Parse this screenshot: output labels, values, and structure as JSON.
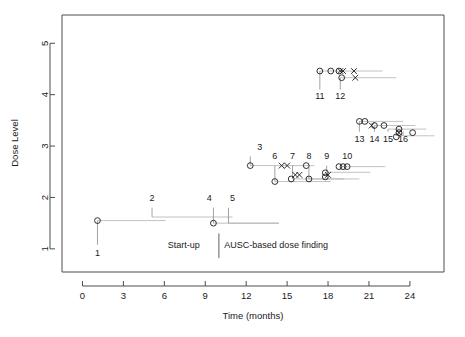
{
  "chart_data": {
    "type": "scatter",
    "title": "",
    "xlabel": "Time (months)",
    "ylabel": "Dose Level",
    "xlim": [
      -1.5,
      26.5
    ],
    "ylim": [
      0.55,
      5.55
    ],
    "xticks": [
      0,
      3,
      6,
      9,
      12,
      15,
      18,
      21,
      24
    ],
    "xtick_labels": [
      "0",
      "3",
      "6",
      "9",
      "12",
      "15",
      "18",
      "21",
      "24"
    ],
    "yticks": [
      1,
      2,
      3,
      4,
      5
    ],
    "ytick_labels": [
      "1",
      "2",
      "3",
      "4",
      "5"
    ],
    "grid": false,
    "legend": null,
    "annotations": [
      {
        "name": "phase-startup",
        "text": "Start-up",
        "x": 8.6,
        "y": 1.08
      },
      {
        "name": "phase-ausc",
        "text": "AUSC-based dose finding",
        "x": 10.4,
        "y": 1.08
      }
    ],
    "phase_divider_x": 10.0,
    "cohorts": [
      {
        "id": "1",
        "label_x": 1.1,
        "label_y": 0.86,
        "line_x0": 1.1,
        "line_x1": 6.1,
        "line_y": 1.55,
        "leader_from_y": 1.08,
        "points": [
          {
            "x": 1.1,
            "y": 1.55,
            "marker": "circle"
          }
        ]
      },
      {
        "id": "2",
        "label_x": 5.1,
        "label_y": 1.93,
        "line_x0": 5.1,
        "line_x1": 11.0,
        "line_y": 1.62,
        "leader_from_y": 1.8,
        "points": []
      },
      {
        "id": "3",
        "label_x": 13.0,
        "label_y": 2.93,
        "line_x0": 12.3,
        "line_x1": 17.0,
        "line_y": 2.62,
        "leader_from_y": 2.8,
        "points": [
          {
            "x": 12.3,
            "y": 2.62,
            "marker": "circle"
          },
          {
            "x": 14.6,
            "y": 2.62,
            "marker": "cross"
          },
          {
            "x": 15.0,
            "y": 2.62,
            "marker": "cross"
          },
          {
            "x": 16.4,
            "y": 2.62,
            "marker": "circle"
          }
        ]
      },
      {
        "id": "4",
        "label_x": 9.3,
        "label_y": 1.93,
        "line_x0": 9.6,
        "line_x1": 14.4,
        "line_y": 1.5,
        "leader_from_y": 1.8,
        "points": [
          {
            "x": 9.6,
            "y": 1.5,
            "marker": "circle"
          }
        ]
      },
      {
        "id": "5",
        "label_x": 11.0,
        "label_y": 1.93,
        "line_x0": 10.7,
        "line_x1": 14.4,
        "line_y": 1.5,
        "leader_from_y": 1.8,
        "points": []
      },
      {
        "id": "6",
        "label_x": 14.1,
        "label_y": 2.74,
        "line_x0": 14.1,
        "line_x1": 18.2,
        "line_y": 2.31,
        "leader_from_y": 2.62,
        "points": [
          {
            "x": 14.1,
            "y": 2.31,
            "marker": "circle"
          }
        ]
      },
      {
        "id": "7",
        "label_x": 15.4,
        "label_y": 2.74,
        "line_x0": 15.4,
        "line_x1": 19.2,
        "line_y": 2.36,
        "leader_from_y": 2.62,
        "points": [
          {
            "x": 15.3,
            "y": 2.36,
            "marker": "circle"
          },
          {
            "x": 15.6,
            "y": 2.44,
            "marker": "cross"
          },
          {
            "x": 15.9,
            "y": 2.44,
            "marker": "cross"
          }
        ]
      },
      {
        "id": "8",
        "label_x": 16.6,
        "label_y": 2.74,
        "line_x0": 16.6,
        "line_x1": 20.3,
        "line_y": 2.36,
        "leader_from_y": 2.62,
        "points": [
          {
            "x": 16.6,
            "y": 2.36,
            "marker": "circle"
          }
        ]
      },
      {
        "id": "9",
        "label_x": 17.9,
        "label_y": 2.74,
        "line_x0": 17.9,
        "line_x1": 21.1,
        "line_y": 2.49,
        "leader_from_y": 2.62,
        "points": [
          {
            "x": 17.8,
            "y": 2.48,
            "marker": "circle"
          },
          {
            "x": 17.8,
            "y": 2.4,
            "marker": "circle"
          },
          {
            "x": 18.0,
            "y": 2.44,
            "marker": "cross"
          }
        ]
      },
      {
        "id": "10",
        "label_x": 19.4,
        "label_y": 2.74,
        "line_x0": 19.0,
        "line_x1": 22.2,
        "line_y": 2.6,
        "leader_from_y": 2.62,
        "points": [
          {
            "x": 18.8,
            "y": 2.6,
            "marker": "circle"
          },
          {
            "x": 19.1,
            "y": 2.6,
            "marker": "circle"
          },
          {
            "x": 19.4,
            "y": 2.6,
            "marker": "circle"
          }
        ]
      },
      {
        "id": "11",
        "label_x": 17.4,
        "label_y": 3.92,
        "line_x0": 17.4,
        "line_x1": 22.0,
        "line_y": 4.46,
        "leader_from_y": 4.1,
        "points": [
          {
            "x": 17.4,
            "y": 4.46,
            "marker": "circle"
          },
          {
            "x": 18.2,
            "y": 4.46,
            "marker": "circle"
          }
        ]
      },
      {
        "id": "12",
        "label_x": 18.9,
        "label_y": 3.92,
        "line_x0": 18.9,
        "line_x1": 23.0,
        "line_y": 4.33,
        "leader_from_y": 4.1,
        "points": [
          {
            "x": 18.8,
            "y": 4.46,
            "marker": "circle"
          },
          {
            "x": 18.9,
            "y": 4.46,
            "marker": "cross"
          },
          {
            "x": 19.1,
            "y": 4.46,
            "marker": "cross"
          },
          {
            "x": 19.0,
            "y": 4.33,
            "marker": "circle"
          },
          {
            "x": 19.9,
            "y": 4.46,
            "marker": "cross"
          },
          {
            "x": 20.0,
            "y": 4.33,
            "marker": "cross"
          }
        ]
      },
      {
        "id": "13",
        "label_x": 20.3,
        "label_y": 3.08,
        "line_x0": 20.3,
        "line_x1": 23.5,
        "line_y": 3.48,
        "leader_from_y": 3.28,
        "points": [
          {
            "x": 20.3,
            "y": 3.48,
            "marker": "circle"
          },
          {
            "x": 20.7,
            "y": 3.48,
            "marker": "circle"
          }
        ]
      },
      {
        "id": "14",
        "label_x": 21.4,
        "label_y": 3.08,
        "line_x0": 21.4,
        "line_x1": 24.4,
        "line_y": 3.4,
        "leader_from_y": 3.28,
        "points": [
          {
            "x": 21.2,
            "y": 3.4,
            "marker": "cross"
          },
          {
            "x": 21.4,
            "y": 3.4,
            "marker": "circle"
          },
          {
            "x": 22.1,
            "y": 3.4,
            "marker": "circle"
          }
        ]
      },
      {
        "id": "15",
        "label_x": 22.4,
        "label_y": 3.08,
        "line_x0": 22.4,
        "line_x1": 25.2,
        "line_y": 3.33,
        "leader_from_y": 3.28,
        "points": [
          {
            "x": 23.2,
            "y": 3.33,
            "marker": "circle"
          }
        ]
      },
      {
        "id": "16",
        "label_x": 23.5,
        "label_y": 3.08,
        "line_x0": 23.5,
        "line_x1": 25.8,
        "line_y": 3.2,
        "leader_from_y": 3.28,
        "points": [
          {
            "x": 23.2,
            "y": 3.26,
            "marker": "cross"
          },
          {
            "x": 23.2,
            "y": 3.26,
            "marker": "circle"
          },
          {
            "x": 23.0,
            "y": 3.18,
            "marker": "circle"
          },
          {
            "x": 24.2,
            "y": 3.26,
            "marker": "circle"
          }
        ]
      }
    ]
  }
}
